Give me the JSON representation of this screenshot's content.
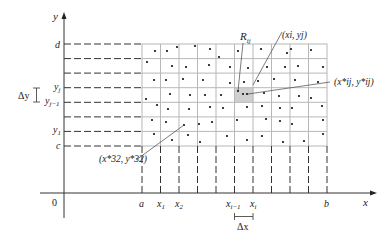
{
  "figure": {
    "axes": {
      "x_label": "x",
      "y_label": "y",
      "origin_label": "0"
    },
    "x_ticks": [
      {
        "label": "a",
        "sub": ""
      },
      {
        "label": "x",
        "sub": "1"
      },
      {
        "label": "x",
        "sub": "2"
      },
      {
        "label": "x",
        "sub": "i−1"
      },
      {
        "label": "x",
        "sub": "i"
      },
      {
        "label": "b",
        "sub": ""
      }
    ],
    "y_ticks": [
      {
        "label": "d",
        "sub": ""
      },
      {
        "label": "y",
        "sub": "j"
      },
      {
        "label": "y",
        "sub": "j−1"
      },
      {
        "label": "y",
        "sub": "1"
      },
      {
        "label": "c",
        "sub": ""
      }
    ],
    "deltas": {
      "dx": "Δx",
      "dy": "Δy"
    },
    "annotations": {
      "rij": "R",
      "rij_sub": "ij",
      "xi_yj": "(x",
      "xi_yj_full": "(xi, yj)",
      "sample_ij": "(x*ij, y*ij)",
      "sample_32": "(x*32, y*32)"
    },
    "colors": {
      "grid": "#b8b8b8",
      "axis": "#333333",
      "highlight": "#d0d0d0",
      "dot": "#111111"
    },
    "grid": {
      "columns": 10,
      "rows": 7
    }
  }
}
